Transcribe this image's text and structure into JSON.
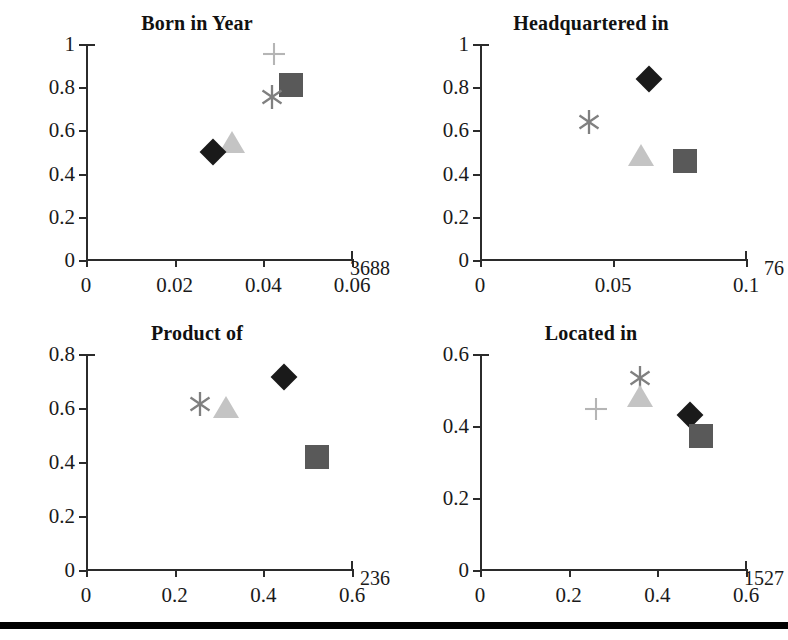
{
  "chart_data": [
    {
      "type": "scatter",
      "title": "Born in Year",
      "xlabel": "",
      "ylabel": "",
      "xlim": [
        0,
        0.06
      ],
      "ylim": [
        0,
        1
      ],
      "xticks": [
        "0",
        "0.02",
        "0.04",
        "0.06"
      ],
      "xtick_values": [
        0,
        0.02,
        0.04,
        0.06
      ],
      "yticks": [
        "0",
        "0.2",
        "0.4",
        "0.6",
        "0.8",
        "1"
      ],
      "ytick_values": [
        0,
        0.2,
        0.4,
        0.6,
        0.8,
        1
      ],
      "grid": false,
      "legend": "none",
      "annotation": "3688",
      "points": [
        {
          "marker": "plus",
          "x": 0.0425,
          "y": 0.955,
          "color": "#b5b5b5"
        },
        {
          "marker": "square",
          "x": 0.0463,
          "y": 0.812,
          "color": "#595959"
        },
        {
          "marker": "asterisk",
          "x": 0.042,
          "y": 0.753,
          "color": "#808080"
        },
        {
          "marker": "triangle",
          "x": 0.033,
          "y": 0.548,
          "color": "#c4c4c4"
        },
        {
          "marker": "diamond",
          "x": 0.0286,
          "y": 0.498,
          "color": "#1a1a1a"
        }
      ]
    },
    {
      "type": "scatter",
      "title": "Headquartered in",
      "xlabel": "",
      "ylabel": "",
      "xlim": [
        0,
        0.1
      ],
      "ylim": [
        0,
        1
      ],
      "xticks": [
        "0",
        "0.05",
        "0.1"
      ],
      "xtick_values": [
        0,
        0.05,
        0.1
      ],
      "yticks": [
        "0",
        "0.2",
        "0.4",
        "0.6",
        "0.8",
        "1"
      ],
      "ytick_values": [
        0,
        0.2,
        0.4,
        0.6,
        0.8,
        1
      ],
      "grid": false,
      "legend": "none",
      "annotation": "76",
      "points": [
        {
          "marker": "diamond",
          "x": 0.0635,
          "y": 0.836,
          "color": "#1a1a1a"
        },
        {
          "marker": "asterisk",
          "x": 0.0408,
          "y": 0.639,
          "color": "#808080"
        },
        {
          "marker": "triangle",
          "x": 0.0605,
          "y": 0.484,
          "color": "#c4c4c4"
        },
        {
          "marker": "square",
          "x": 0.0772,
          "y": 0.459,
          "color": "#595959"
        }
      ]
    },
    {
      "type": "scatter",
      "title": "Product of",
      "xlabel": "",
      "ylabel": "",
      "xlim": [
        0,
        0.6
      ],
      "ylim": [
        0,
        0.8
      ],
      "xticks": [
        "0",
        "0.2",
        "0.4",
        "0.6"
      ],
      "xtick_values": [
        0,
        0.2,
        0.4,
        0.6
      ],
      "yticks": [
        "0",
        "0.2",
        "0.4",
        "0.6",
        "0.8"
      ],
      "ytick_values": [
        0,
        0.2,
        0.4,
        0.6,
        0.8
      ],
      "grid": false,
      "legend": "none",
      "annotation": "236",
      "points": [
        {
          "marker": "diamond",
          "x": 0.447,
          "y": 0.716,
          "color": "#1a1a1a"
        },
        {
          "marker": "asterisk",
          "x": 0.258,
          "y": 0.614,
          "color": "#808080"
        },
        {
          "marker": "triangle",
          "x": 0.315,
          "y": 0.603,
          "color": "#c4c4c4"
        },
        {
          "marker": "square",
          "x": 0.521,
          "y": 0.417,
          "color": "#595959"
        }
      ]
    },
    {
      "type": "scatter",
      "title": "Located in",
      "xlabel": "",
      "ylabel": "",
      "xlim": [
        0,
        0.6
      ],
      "ylim": [
        0,
        0.6
      ],
      "xticks": [
        "0",
        "0.2",
        "0.4",
        "0.6"
      ],
      "xtick_values": [
        0,
        0.2,
        0.4,
        0.6
      ],
      "yticks": [
        "0",
        "0.2",
        "0.4",
        "0.6"
      ],
      "ytick_values": [
        0,
        0.2,
        0.4,
        0.6
      ],
      "grid": false,
      "legend": "none",
      "annotation": "1527",
      "points": [
        {
          "marker": "asterisk",
          "x": 0.36,
          "y": 0.532,
          "color": "#808080"
        },
        {
          "marker": "triangle",
          "x": 0.36,
          "y": 0.484,
          "color": "#c4c4c4"
        },
        {
          "marker": "plus",
          "x": 0.262,
          "y": 0.447,
          "color": "#b5b5b5"
        },
        {
          "marker": "diamond",
          "x": 0.474,
          "y": 0.43,
          "color": "#1a1a1a"
        },
        {
          "marker": "square",
          "x": 0.498,
          "y": 0.373,
          "color": "#595959"
        }
      ]
    }
  ]
}
